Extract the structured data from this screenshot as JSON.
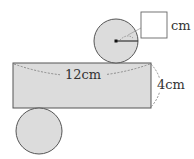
{
  "diagram": {
    "type": "cylinder-net",
    "colors": {
      "fill": "#dcdcdc",
      "stroke": "#555555",
      "dashed": "#777777",
      "text": "#333333",
      "box_fill": "#ffffff"
    },
    "rectangle": {
      "width_label": "12cm",
      "height_label": "4cm"
    },
    "top_circle": {
      "radius_label_box": "",
      "unit_label": "cm"
    },
    "bottom_circle": {}
  }
}
